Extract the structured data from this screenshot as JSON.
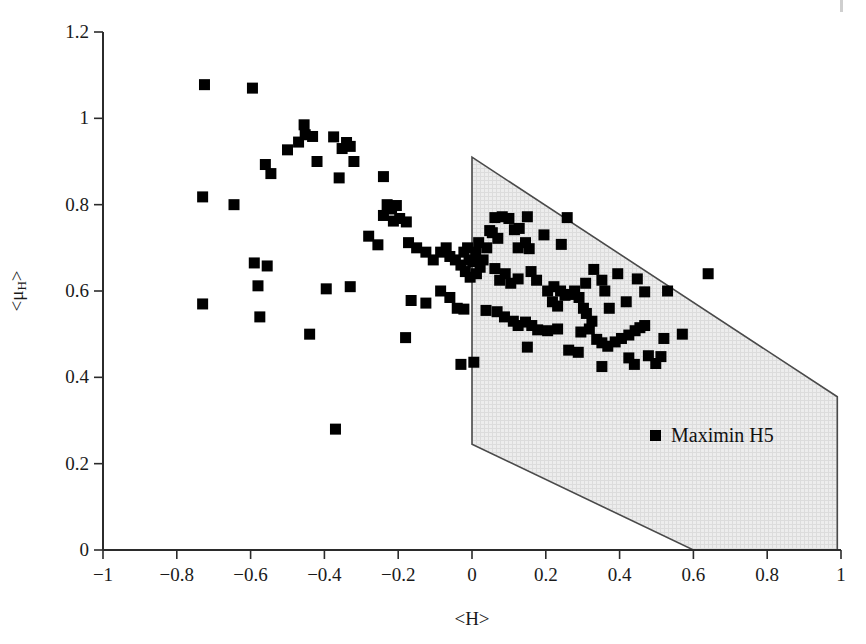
{
  "chart_data": {
    "type": "scatter",
    "title": "",
    "xlabel": "<H>",
    "ylabel": "<μ_H>",
    "xlim": [
      -1,
      1
    ],
    "ylim": [
      0,
      1.2
    ],
    "xticks": [
      "-1",
      "-0.8",
      "-0.6",
      "-0.4",
      "-0.2",
      "0",
      "0.2",
      "0.4",
      "0.6",
      "0.8",
      "1"
    ],
    "xtick_values": [
      -1,
      -0.8,
      -0.6,
      -0.4,
      -0.2,
      0,
      0.2,
      0.4,
      0.6,
      0.8,
      1
    ],
    "yticks": [
      "0",
      "0.2",
      "0.4",
      "0.6",
      "0.8",
      "1",
      "1.2"
    ],
    "ytick_values": [
      0,
      0.2,
      0.4,
      0.6,
      0.8,
      1,
      1.2
    ],
    "grid": false,
    "legend_position": "inside-lower-right",
    "series": [
      {
        "name": "Maximin H5",
        "marker": "square",
        "color": "#000000",
        "points": [
          [
            -0.725,
            1.078
          ],
          [
            -0.595,
            1.07
          ],
          [
            -0.455,
            0.985
          ],
          [
            -0.452,
            0.962
          ],
          [
            -0.432,
            0.958
          ],
          [
            -0.47,
            0.945
          ],
          [
            -0.375,
            0.957
          ],
          [
            -0.34,
            0.944
          ],
          [
            -0.352,
            0.93
          ],
          [
            -0.33,
            0.935
          ],
          [
            -0.5,
            0.927
          ],
          [
            -0.42,
            0.9
          ],
          [
            -0.32,
            0.9
          ],
          [
            -0.56,
            0.893
          ],
          [
            -0.545,
            0.872
          ],
          [
            -0.36,
            0.862
          ],
          [
            -0.24,
            0.865
          ],
          [
            -0.73,
            0.818
          ],
          [
            -0.645,
            0.8
          ],
          [
            -0.23,
            0.8
          ],
          [
            -0.218,
            0.79
          ],
          [
            -0.205,
            0.798
          ],
          [
            -0.24,
            0.775
          ],
          [
            -0.213,
            0.762
          ],
          [
            -0.196,
            0.768
          ],
          [
            -0.178,
            0.76
          ],
          [
            -0.28,
            0.727
          ],
          [
            -0.255,
            0.707
          ],
          [
            -0.172,
            0.712
          ],
          [
            -0.15,
            0.7
          ],
          [
            -0.125,
            0.69
          ],
          [
            -0.59,
            0.665
          ],
          [
            -0.555,
            0.658
          ],
          [
            -0.58,
            0.612
          ],
          [
            -0.73,
            0.57
          ],
          [
            -0.575,
            0.54
          ],
          [
            -0.105,
            0.672
          ],
          [
            -0.085,
            0.69
          ],
          [
            -0.07,
            0.7
          ],
          [
            -0.06,
            0.68
          ],
          [
            -0.045,
            0.672
          ],
          [
            -0.03,
            0.66
          ],
          [
            -0.022,
            0.69
          ],
          [
            -0.012,
            0.7
          ],
          [
            -0.008,
            0.672
          ],
          [
            0.002,
            0.668
          ],
          [
            0.01,
            0.69
          ],
          [
            0.018,
            0.712
          ],
          [
            -0.018,
            0.645
          ],
          [
            -0.005,
            0.632
          ],
          [
            0.012,
            0.64
          ],
          [
            0.022,
            0.655
          ],
          [
            0.03,
            0.672
          ],
          [
            0.04,
            0.7
          ],
          [
            0.048,
            0.74
          ],
          [
            -0.33,
            0.61
          ],
          [
            -0.395,
            0.605
          ],
          [
            -0.44,
            0.5
          ],
          [
            -0.37,
            0.28
          ],
          [
            -0.165,
            0.578
          ],
          [
            -0.125,
            0.572
          ],
          [
            -0.18,
            0.492
          ],
          [
            -0.085,
            0.6
          ],
          [
            -0.06,
            0.585
          ],
          [
            -0.04,
            0.56
          ],
          [
            -0.022,
            0.558
          ],
          [
            -0.03,
            0.43
          ],
          [
            0.005,
            0.435
          ],
          [
            0.062,
            0.77
          ],
          [
            0.082,
            0.772
          ],
          [
            0.1,
            0.768
          ],
          [
            0.15,
            0.772
          ],
          [
            0.128,
            0.745
          ],
          [
            0.258,
            0.77
          ],
          [
            0.055,
            0.735
          ],
          [
            0.07,
            0.722
          ],
          [
            0.115,
            0.742
          ],
          [
            0.125,
            0.7
          ],
          [
            0.145,
            0.712
          ],
          [
            0.155,
            0.698
          ],
          [
            0.195,
            0.73
          ],
          [
            0.242,
            0.708
          ],
          [
            0.062,
            0.652
          ],
          [
            0.09,
            0.64
          ],
          [
            0.105,
            0.618
          ],
          [
            0.125,
            0.628
          ],
          [
            0.16,
            0.645
          ],
          [
            0.175,
            0.625
          ],
          [
            0.205,
            0.6
          ],
          [
            0.222,
            0.61
          ],
          [
            0.24,
            0.6
          ],
          [
            0.252,
            0.59
          ],
          [
            0.265,
            0.592
          ],
          [
            0.278,
            0.6
          ],
          [
            0.29,
            0.585
          ],
          [
            0.218,
            0.575
          ],
          [
            0.232,
            0.565
          ],
          [
            0.308,
            0.618
          ],
          [
            0.33,
            0.65
          ],
          [
            0.352,
            0.625
          ],
          [
            0.395,
            0.64
          ],
          [
            0.448,
            0.628
          ],
          [
            0.468,
            0.598
          ],
          [
            0.36,
            0.6
          ],
          [
            0.372,
            0.56
          ],
          [
            0.418,
            0.575
          ],
          [
            0.302,
            0.56
          ],
          [
            0.31,
            0.548
          ],
          [
            0.325,
            0.53
          ],
          [
            0.068,
            0.552
          ],
          [
            0.088,
            0.54
          ],
          [
            0.112,
            0.53
          ],
          [
            0.125,
            0.52
          ],
          [
            0.145,
            0.528
          ],
          [
            0.162,
            0.52
          ],
          [
            0.178,
            0.51
          ],
          [
            0.205,
            0.508
          ],
          [
            0.232,
            0.512
          ],
          [
            0.295,
            0.505
          ],
          [
            0.318,
            0.512
          ],
          [
            0.338,
            0.488
          ],
          [
            0.352,
            0.48
          ],
          [
            0.368,
            0.472
          ],
          [
            0.388,
            0.482
          ],
          [
            0.405,
            0.49
          ],
          [
            0.425,
            0.498
          ],
          [
            0.442,
            0.508
          ],
          [
            0.455,
            0.515
          ],
          [
            0.468,
            0.52
          ],
          [
            0.262,
            0.463
          ],
          [
            0.288,
            0.458
          ],
          [
            0.15,
            0.47
          ],
          [
            0.352,
            0.425
          ],
          [
            0.425,
            0.445
          ],
          [
            0.44,
            0.43
          ],
          [
            0.478,
            0.45
          ],
          [
            0.498,
            0.432
          ],
          [
            0.512,
            0.448
          ],
          [
            0.53,
            0.6
          ],
          [
            0.52,
            0.49
          ],
          [
            0.57,
            0.5
          ],
          [
            0.64,
            0.64
          ],
          [
            0.075,
            0.625
          ],
          [
            0.038,
            0.555
          ]
        ]
      }
    ],
    "shaded_region": {
      "label": "feasible-region",
      "fill": "#e9e9e9",
      "stroke": "#4a4a4a",
      "vertices": [
        [
          0.0,
          0.91
        ],
        [
          0.99,
          0.355
        ],
        [
          0.99,
          0.0
        ],
        [
          0.6,
          0.0
        ],
        [
          0.0,
          0.245
        ]
      ]
    }
  },
  "legend": {
    "marker_label": "Maximin H5"
  },
  "axes": {
    "x_title": "<H>",
    "y_title_prefix": "<μ",
    "y_title_sub": "H",
    "y_title_suffix": ">"
  }
}
